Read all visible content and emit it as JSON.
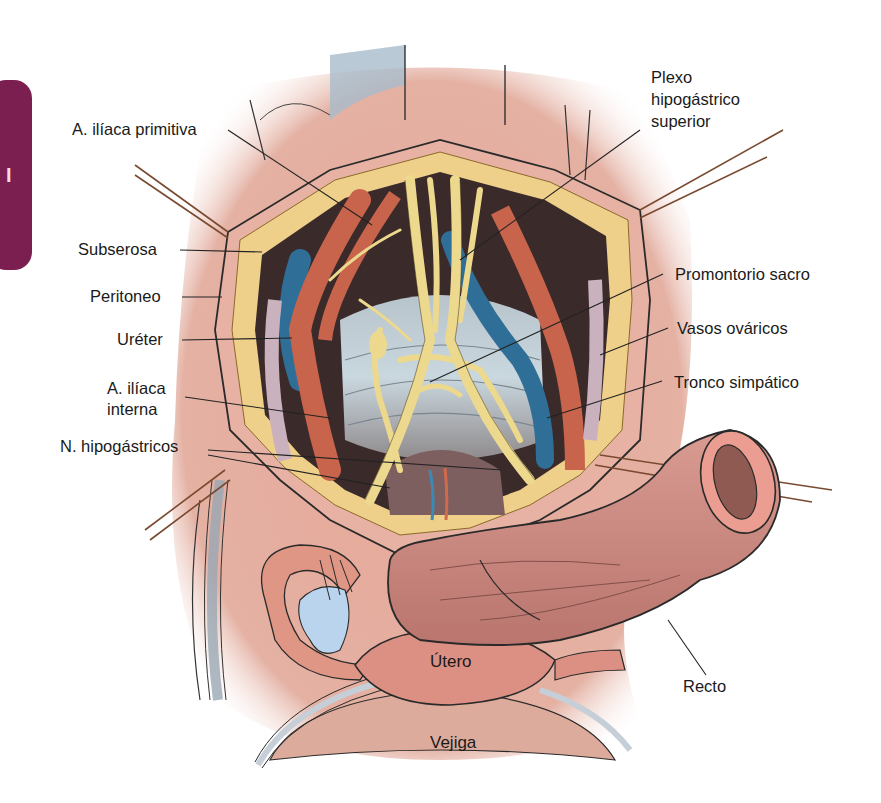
{
  "figure": {
    "chapter_tab": {
      "text": "I",
      "color": "#7a1f4f"
    },
    "colors": {
      "fat": "#f0d48a",
      "nerve": "#ecd98e",
      "artery": "#c8644c",
      "vein": "#2f6f97",
      "peritoneum": "#e8a99a",
      "bowel": "#cf8f86",
      "ovary": "#b9d4ec",
      "leader_line": "#222222"
    },
    "labels_left": [
      {
        "id": "a-iliaca-primitiva",
        "text": "A. ilíaca primitiva"
      },
      {
        "id": "subserosa",
        "text": "Subserosa"
      },
      {
        "id": "peritoneo",
        "text": "Peritoneo"
      },
      {
        "id": "ureter",
        "text": "Uréter"
      },
      {
        "id": "a-iliaca-interna-1",
        "text": "A. ilíaca"
      },
      {
        "id": "a-iliaca-interna-2",
        "text": "interna"
      },
      {
        "id": "n-hipogastricos",
        "text": "N. hipogástricos"
      }
    ],
    "labels_right": [
      {
        "id": "plexo-1",
        "text": "Plexo"
      },
      {
        "id": "plexo-2",
        "text": "hipogástrico"
      },
      {
        "id": "plexo-3",
        "text": "superior"
      },
      {
        "id": "promontorio-sacro",
        "text": "Promontorio sacro"
      },
      {
        "id": "vasos-ovaricos",
        "text": "Vasos ováricos"
      },
      {
        "id": "tronco-simpatico",
        "text": "Tronco simpático"
      },
      {
        "id": "recto",
        "text": "Recto"
      }
    ],
    "labels_inline": [
      {
        "id": "utero",
        "text": "Útero"
      },
      {
        "id": "vejiga",
        "text": "Vejiga"
      }
    ]
  }
}
